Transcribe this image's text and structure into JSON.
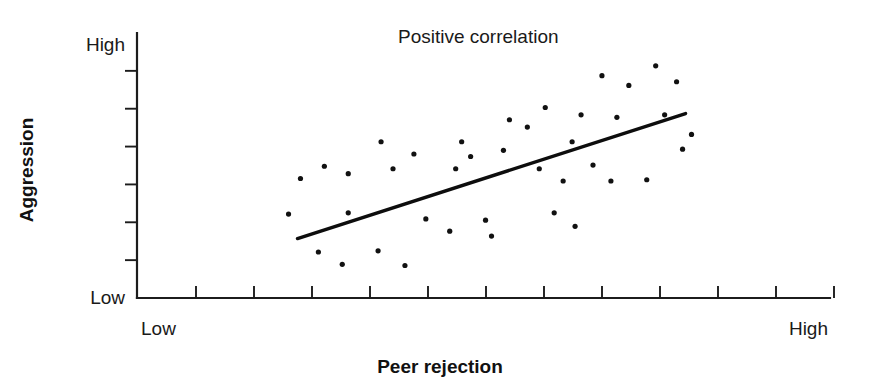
{
  "figure": {
    "background": "#ffffff",
    "ink_color": "#111111",
    "width": 874,
    "height": 392
  },
  "labels": {
    "title": "Positive correlation",
    "y_axis_title": "Aggression",
    "x_axis_title": "Peer rejection",
    "y_low": "Low",
    "y_high": "High",
    "x_low": "Low",
    "x_high": "High"
  },
  "chart_data": {
    "type": "scatter",
    "title": "Positive correlation",
    "xlabel": "Peer rejection",
    "ylabel": "Aggression",
    "xlim": [
      0,
      100
    ],
    "ylim": [
      0,
      100
    ],
    "grid": false,
    "legend": false,
    "x_tick_labels": [
      "Low",
      "High"
    ],
    "y_tick_labels": [
      "Low",
      "High"
    ],
    "x_tick_count": 12,
    "y_tick_count": 6,
    "annotations": [
      {
        "text": "Positive correlation",
        "x": 47,
        "y": 97
      }
    ],
    "trend_line": {
      "name": "line of best fit",
      "x0": 17.0,
      "y0": 21.0,
      "x1": 82.0,
      "y1": 72.0
    },
    "points": [
      {
        "x": 15.5,
        "y": 31.0
      },
      {
        "x": 17.5,
        "y": 45.5
      },
      {
        "x": 20.5,
        "y": 15.5
      },
      {
        "x": 21.5,
        "y": 50.5
      },
      {
        "x": 24.5,
        "y": 10.5
      },
      {
        "x": 25.5,
        "y": 31.5
      },
      {
        "x": 25.5,
        "y": 47.5
      },
      {
        "x": 30.5,
        "y": 16.0
      },
      {
        "x": 31.0,
        "y": 60.5
      },
      {
        "x": 33.0,
        "y": 49.5
      },
      {
        "x": 35.0,
        "y": 10.0
      },
      {
        "x": 36.5,
        "y": 55.5
      },
      {
        "x": 38.5,
        "y": 29.0
      },
      {
        "x": 42.5,
        "y": 24.0
      },
      {
        "x": 43.5,
        "y": 49.5
      },
      {
        "x": 44.5,
        "y": 60.5
      },
      {
        "x": 46.0,
        "y": 54.5
      },
      {
        "x": 48.5,
        "y": 28.5
      },
      {
        "x": 49.5,
        "y": 22.0
      },
      {
        "x": 51.5,
        "y": 57.0
      },
      {
        "x": 52.5,
        "y": 69.5
      },
      {
        "x": 55.5,
        "y": 66.5
      },
      {
        "x": 57.5,
        "y": 49.5
      },
      {
        "x": 58.5,
        "y": 74.5
      },
      {
        "x": 60.0,
        "y": 31.5
      },
      {
        "x": 61.5,
        "y": 44.5
      },
      {
        "x": 63.0,
        "y": 60.5
      },
      {
        "x": 64.5,
        "y": 71.5
      },
      {
        "x": 66.5,
        "y": 51.0
      },
      {
        "x": 68.0,
        "y": 87.5
      },
      {
        "x": 69.5,
        "y": 44.5
      },
      {
        "x": 70.5,
        "y": 70.5
      },
      {
        "x": 72.5,
        "y": 83.5
      },
      {
        "x": 75.5,
        "y": 45.0
      },
      {
        "x": 77.0,
        "y": 91.5
      },
      {
        "x": 78.5,
        "y": 71.5
      },
      {
        "x": 80.5,
        "y": 85.0
      },
      {
        "x": 81.5,
        "y": 57.5
      },
      {
        "x": 83.0,
        "y": 63.5
      },
      {
        "x": 63.5,
        "y": 26.0
      }
    ]
  },
  "geometry": {
    "axis_origin_x": 137,
    "axis_origin_y": 298,
    "axis_top_y": 33,
    "axis_right_x": 830,
    "x_tick_first": 196,
    "x_tick_spacing": 58,
    "x_tick_length": 12,
    "y_tick_length": 12,
    "point_radius": 2.6,
    "plot_x0": 196,
    "plot_x1": 793,
    "plot_y0": 290,
    "plot_y1": 45
  }
}
